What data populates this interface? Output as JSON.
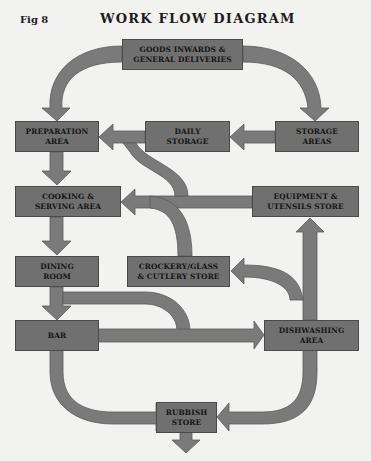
{
  "figure": {
    "label": "Fig 8",
    "title": "WORK FLOW DIAGRAM"
  },
  "colors": {
    "box_fill": "#707070",
    "arrow_fill": "#7a7a7a",
    "background": "#f2f2f0",
    "text": "#141414"
  },
  "nodes": {
    "goods_inwards": "GOODS INWARDS &\nGENERAL DELIVERIES",
    "preparation": "PREPARATION\nAREA",
    "daily_storage": "DAILY\nSTORAGE",
    "storage_areas": "STORAGE\nAREAS",
    "cooking": "COOKING &\nSERVING AREA",
    "equipment": "EQUIPMENT &\nUTENSILS STORE",
    "dining": "DINING\nROOM",
    "crockery": "CROCKERY/GLASS\n& CUTLERY STORE",
    "bar": "BAR",
    "dishwashing": "DISHWASHING\nAREA",
    "rubbish": "RUBBISH\nSTORE"
  },
  "flows": [
    {
      "from": "GOODS INWARDS & GENERAL DELIVERIES",
      "to": "PREPARATION AREA"
    },
    {
      "from": "GOODS INWARDS & GENERAL DELIVERIES",
      "to": "STORAGE AREAS"
    },
    {
      "from": "STORAGE AREAS",
      "to": "DAILY STORAGE"
    },
    {
      "from": "DAILY STORAGE",
      "to": "PREPARATION AREA"
    },
    {
      "from": "EQUIPMENT & UTENSILS STORE",
      "to": "PREPARATION AREA"
    },
    {
      "from": "EQUIPMENT & UTENSILS STORE",
      "to": "COOKING & SERVING AREA"
    },
    {
      "from": "CROCKERY/GLASS & CUTLERY STORE",
      "to": "COOKING & SERVING AREA"
    },
    {
      "from": "PREPARATION AREA",
      "to": "COOKING & SERVING AREA"
    },
    {
      "from": "COOKING & SERVING AREA",
      "to": "DINING ROOM"
    },
    {
      "from": "DINING ROOM",
      "to": "BAR"
    },
    {
      "from": "DINING ROOM",
      "to": "DISHWASHING AREA"
    },
    {
      "from": "BAR",
      "to": "DISHWASHING AREA"
    },
    {
      "from": "DISHWASHING AREA",
      "to": "CROCKERY/GLASS & CUTLERY STORE"
    },
    {
      "from": "DISHWASHING AREA",
      "to": "EQUIPMENT & UTENSILS STORE"
    },
    {
      "from": "BAR",
      "to": "RUBBISH STORE"
    },
    {
      "from": "DISHWASHING AREA",
      "to": "RUBBISH STORE"
    },
    {
      "from": "RUBBISH STORE",
      "to": "out"
    }
  ]
}
